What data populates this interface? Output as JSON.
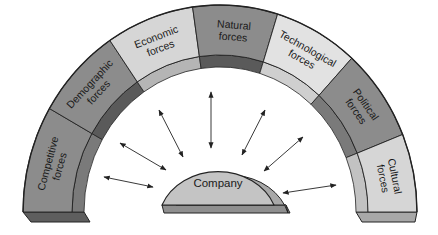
{
  "diagram": {
    "type": "macroenvironment-arch",
    "center": {
      "label": "Company",
      "fill": "#c4c4c4",
      "side_fill": "#a9a9a9",
      "bottom_fill": "#8f8f8f"
    },
    "segments": [
      {
        "id": "competitive",
        "lines": [
          "Competitive",
          "forces"
        ],
        "fill": "#8c8c8c",
        "wall_fill": "#7a7a7a"
      },
      {
        "id": "demographic",
        "lines": [
          "Demographic",
          "forces"
        ],
        "fill": "#8c8c8c",
        "wall_fill": "#5a5a5a"
      },
      {
        "id": "economic",
        "lines": [
          "Economic",
          "forces"
        ],
        "fill": "#d6d6d6",
        "wall_fill": "#b5b5b5"
      },
      {
        "id": "natural",
        "lines": [
          "Natural",
          "forces"
        ],
        "fill": "#8c8c8c",
        "wall_fill": "#5a5a5a"
      },
      {
        "id": "technological",
        "lines": [
          "Technological",
          "forces"
        ],
        "fill": "#e2e2e2",
        "wall_fill": "#cfcfcf"
      },
      {
        "id": "political",
        "lines": [
          "Political",
          "forces"
        ],
        "fill": "#8c8c8c",
        "wall_fill": "#7a7a7a"
      },
      {
        "id": "cultural",
        "lines": [
          "Cultural",
          "forces"
        ],
        "fill": "#d6d6d6",
        "wall_fill": "#c2c2c2"
      }
    ],
    "arrows": {
      "count": 7,
      "style": "double-headed",
      "color": "#222222"
    },
    "outline_color": "#222222"
  }
}
